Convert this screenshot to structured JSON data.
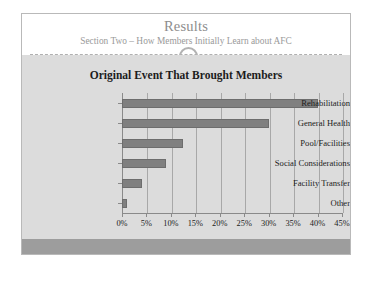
{
  "slide": {
    "title": "Results",
    "subtitle": "Section Two – How Members Initially Learn about AFC",
    "ornament": "ring-ornament"
  },
  "colors": {
    "slide_background": "#ffffff",
    "body_background": "#dcdcdc",
    "footer_bar": "#9d9d9d",
    "bar_fill": "#808080",
    "bar_stroke": "#6d6d6d",
    "axis": "#8a8a8a",
    "gridline": "#a8a8a8",
    "title_text": "#8d8d8d",
    "chart_title_text": "#1c1c1c"
  },
  "chart_data": {
    "type": "bar",
    "orientation": "horizontal",
    "title": "Original Event That Brought Members",
    "xlabel": "",
    "ylabel": "",
    "categories": [
      "Rehabilitation",
      "General Health",
      "Pool/Facilities",
      "Social Considerations",
      "Facility Transfer",
      "Other"
    ],
    "values": [
      40,
      30,
      12.5,
      9,
      4,
      1
    ],
    "value_suffix": "%",
    "xlim": [
      0,
      45
    ],
    "xticks": [
      0,
      5,
      10,
      15,
      20,
      25,
      30,
      35,
      40,
      45
    ],
    "xtick_labels": [
      "0%",
      "5%",
      "10%",
      "15%",
      "20%",
      "25%",
      "30%",
      "35%",
      "40%",
      "45%"
    ],
    "grid": true,
    "grid_axis": "x",
    "legend": false,
    "legend_position": "none"
  }
}
